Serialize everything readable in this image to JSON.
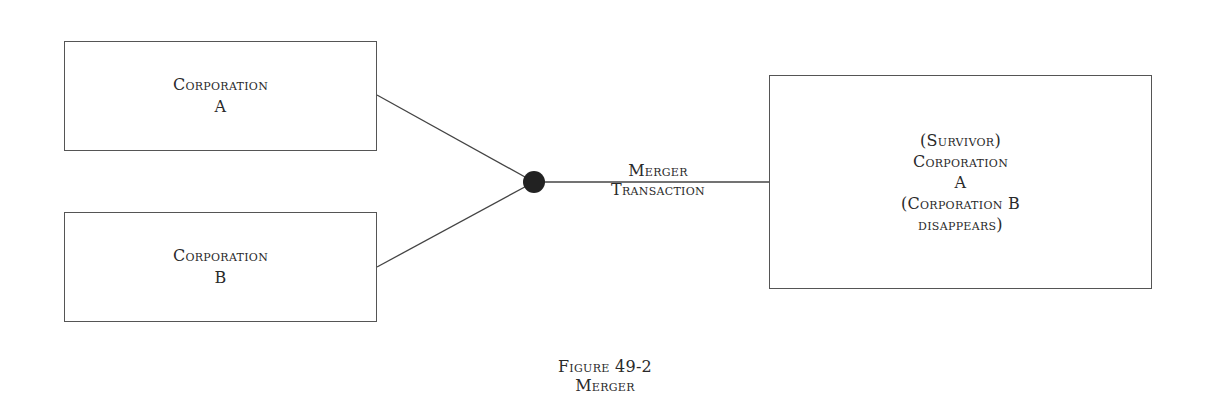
{
  "diagram": {
    "nodes": [
      {
        "id": "corp-a",
        "lines": [
          "Corporation",
          "A"
        ]
      },
      {
        "id": "corp-b",
        "lines": [
          "Corporation",
          "B"
        ]
      },
      {
        "id": "survivor",
        "lines": [
          "(Survivor)",
          "Corporation",
          "A",
          "(Corporation B",
          "disappears)"
        ]
      }
    ],
    "edge_label": {
      "line1": "Merger",
      "line2": "Transaction"
    },
    "caption": {
      "line1": "Figure 49-2",
      "line2": "Merger"
    },
    "colors": {
      "line": "#555555",
      "junction": "#222222"
    }
  }
}
